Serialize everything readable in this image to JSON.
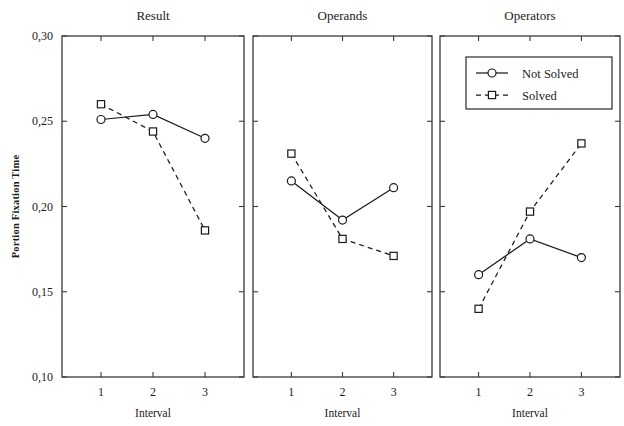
{
  "chart_data": {
    "type": "line",
    "title": "",
    "subtitle": "",
    "xlabel": "Interval",
    "ylabel": "Portion Fixation Time",
    "x": [
      1,
      2,
      3
    ],
    "xtick_labels": [
      "1",
      "2",
      "3"
    ],
    "ylim": [
      0.1,
      0.3
    ],
    "ytick_values": [
      0.1,
      0.15,
      0.2,
      0.25,
      0.3
    ],
    "ytick_labels": [
      "0,10",
      "0,15",
      "0,20",
      "0,25",
      "0,30"
    ],
    "grid": false,
    "legend_position": "top-right of third panel",
    "legend_entries": [
      "Not Solved",
      "Solved"
    ],
    "panels": [
      {
        "title": "Result",
        "series": [
          {
            "name": "Not Solved",
            "style": "solid",
            "marker": "circle",
            "values": [
              0.251,
              0.254,
              0.24
            ]
          },
          {
            "name": "Solved",
            "style": "dashed",
            "marker": "square",
            "values": [
              0.26,
              0.244,
              0.186
            ]
          }
        ]
      },
      {
        "title": "Operands",
        "series": [
          {
            "name": "Not Solved",
            "style": "solid",
            "marker": "circle",
            "values": [
              0.215,
              0.192,
              0.211
            ]
          },
          {
            "name": "Solved",
            "style": "dashed",
            "marker": "square",
            "values": [
              0.231,
              0.181,
              0.171
            ]
          }
        ]
      },
      {
        "title": "Operators",
        "series": [
          {
            "name": "Not Solved",
            "style": "solid",
            "marker": "circle",
            "values": [
              0.16,
              0.181,
              0.17
            ]
          },
          {
            "name": "Solved",
            "style": "dashed",
            "marker": "square",
            "values": [
              0.14,
              0.197,
              0.237
            ]
          }
        ]
      }
    ],
    "colors": {
      "line": "#1a1a1a",
      "frame": "#3a3a3a",
      "background": "#ffffff",
      "marker_fill": "#ffffff"
    }
  }
}
